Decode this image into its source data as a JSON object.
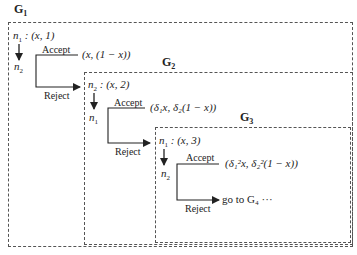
{
  "diagram": {
    "groups": [
      {
        "id": "G1",
        "label": "G",
        "sub": "1"
      },
      {
        "id": "G2",
        "label": "G",
        "sub": "2"
      },
      {
        "id": "G3",
        "label": "G",
        "sub": "3"
      }
    ],
    "stages": [
      {
        "proposer": "n",
        "proposer_sub": "1",
        "offer": ": (x, 1)",
        "responder": "n",
        "responder_sub": "2",
        "accept_label": "Accept",
        "accept_payoff": "(x, (1 − x))",
        "reject_label": "Reject"
      },
      {
        "proposer": "n",
        "proposer_sub": "2",
        "offer": ": (x, 2)",
        "responder": "n",
        "responder_sub": "1",
        "accept_label": "Accept",
        "accept_payoff": "(δ₁x, δ₂(1 − x))",
        "reject_label": "Reject"
      },
      {
        "proposer": "n",
        "proposer_sub": "1",
        "offer": ": (x, 3)",
        "responder": "n",
        "responder_sub": "2",
        "accept_label": "Accept",
        "accept_payoff": "(δ₁²x, δ₂²(1 − x))",
        "reject_label": "Reject",
        "reject_target": "go to G₄ ···"
      }
    ]
  }
}
